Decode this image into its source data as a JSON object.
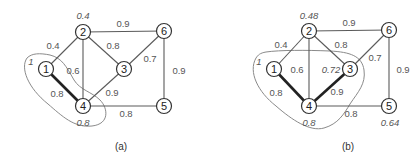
{
  "diagram": {
    "type": "weighted-graph-pair",
    "panels": [
      {
        "caption": "(a)",
        "nodes": [
          {
            "id": "1",
            "label": "1",
            "x": 46,
            "y": 69,
            "value": "1"
          },
          {
            "id": "2",
            "label": "2",
            "x": 83,
            "y": 32,
            "value": "0.4"
          },
          {
            "id": "3",
            "label": "3",
            "x": 124,
            "y": 69,
            "value": ""
          },
          {
            "id": "4",
            "label": "4",
            "x": 83,
            "y": 106,
            "value": "0.8"
          },
          {
            "id": "5",
            "label": "5",
            "x": 164,
            "y": 106,
            "value": ""
          },
          {
            "id": "6",
            "label": "6",
            "x": 164,
            "y": 31,
            "value": ""
          }
        ],
        "edges": [
          {
            "from": "1",
            "to": "2",
            "weight": "0.4",
            "bold": false
          },
          {
            "from": "1",
            "to": "4",
            "weight": "0.8",
            "bold": true
          },
          {
            "from": "2",
            "to": "4",
            "weight": "0.6",
            "bold": false
          },
          {
            "from": "2",
            "to": "3",
            "weight": "0.8",
            "bold": false
          },
          {
            "from": "2",
            "to": "6",
            "weight": "0.9",
            "bold": false
          },
          {
            "from": "3",
            "to": "4",
            "weight": "0.9",
            "bold": false
          },
          {
            "from": "3",
            "to": "6",
            "weight": "0.7",
            "bold": false
          },
          {
            "from": "4",
            "to": "5",
            "weight": "0.8",
            "bold": false
          },
          {
            "from": "5",
            "to": "6",
            "weight": "0.9",
            "bold": false
          }
        ],
        "labels": {
          "p1": "1",
          "p2": "0.4",
          "p4": "0.8",
          "w12": "0.4",
          "w14": "0.8",
          "w24": "0.6",
          "w23": "0.8",
          "w26": "0.9",
          "w34": "0.9",
          "w36": "0.7",
          "w45": "0.8",
          "w56": "0.9"
        },
        "region_nodes": [
          "1",
          "4"
        ]
      },
      {
        "caption": "(b)",
        "nodes": [
          {
            "id": "1",
            "label": "1",
            "x": 274,
            "y": 69,
            "value": "1"
          },
          {
            "id": "2",
            "label": "2",
            "x": 309,
            "y": 31,
            "value": "0.48"
          },
          {
            "id": "3",
            "label": "3",
            "x": 350,
            "y": 69,
            "value": "0.72"
          },
          {
            "id": "4",
            "label": "4",
            "x": 309,
            "y": 106,
            "value": "0.8"
          },
          {
            "id": "5",
            "label": "5",
            "x": 389,
            "y": 106,
            "value": "0.64"
          },
          {
            "id": "6",
            "label": "6",
            "x": 389,
            "y": 30,
            "value": ""
          }
        ],
        "edges": [
          {
            "from": "1",
            "to": "2",
            "weight": "0.4",
            "bold": false
          },
          {
            "from": "1",
            "to": "4",
            "weight": "0.8",
            "bold": true
          },
          {
            "from": "2",
            "to": "4",
            "weight": "0.6",
            "bold": false
          },
          {
            "from": "2",
            "to": "3",
            "weight": "0.8",
            "bold": false
          },
          {
            "from": "2",
            "to": "6",
            "weight": "0.9",
            "bold": false
          },
          {
            "from": "3",
            "to": "4",
            "weight": "0.9",
            "bold": true
          },
          {
            "from": "3",
            "to": "6",
            "weight": "0.7",
            "bold": false
          },
          {
            "from": "4",
            "to": "5",
            "weight": "0.8",
            "bold": false
          },
          {
            "from": "5",
            "to": "6",
            "weight": "0.9",
            "bold": false
          }
        ],
        "labels": {
          "p1": "1",
          "p2": "0.48",
          "p3": "0.72",
          "p4": "0.8",
          "p5": "0.64",
          "w12": "0.4",
          "w14": "0.8",
          "w24": "0.6",
          "w23": "0.8",
          "w26": "0.9",
          "w34": "0.9",
          "w36": "0.7",
          "w45": "0.8",
          "w56": "0.9"
        },
        "region_nodes": [
          "1",
          "3",
          "4"
        ]
      }
    ]
  }
}
